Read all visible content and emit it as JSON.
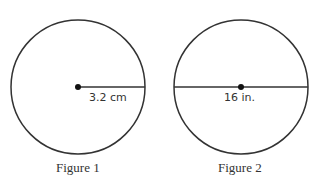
{
  "figures": [
    {
      "caption": "Figure 1",
      "measure_label": "3.2 cm",
      "segment": "radius"
    },
    {
      "caption": "Figure 2",
      "measure_label": "16 in.",
      "segment": "diameter"
    }
  ]
}
